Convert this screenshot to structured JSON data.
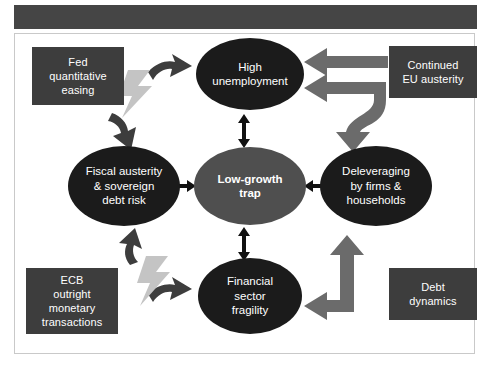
{
  "figure": {
    "banner_color": "#454545",
    "frame_color": "#c9c9c9",
    "background": "#ffffff"
  },
  "palette": {
    "box_fill": "#3d3d3d",
    "ellipse_dark": "#1b1b1b",
    "ellipse_center": "#4f4f4f",
    "arrow_black": "#111111",
    "arrow_gray": "#6b6b6b",
    "arrow_dark": "#3d3d3d",
    "bolt_gray": "#c4c4c4",
    "text": "#ffffff"
  },
  "nodes": {
    "boxes": [
      {
        "id": "fed-quantitative-easing",
        "lines": [
          "Fed",
          "quantitative",
          "easing"
        ],
        "x": 32,
        "y": 47,
        "w": 92,
        "h": 58
      },
      {
        "id": "continued-eu-austerity",
        "lines": [
          "Continued",
          "EU austerity"
        ],
        "x": 389,
        "y": 46,
        "w": 88,
        "h": 52
      },
      {
        "id": "ecb-outright-monetary-transactions",
        "lines": [
          "ECB",
          "outright",
          "monetary",
          "transactions"
        ],
        "x": 26,
        "y": 268,
        "w": 92,
        "h": 66
      },
      {
        "id": "debt-dynamics",
        "lines": [
          "Debt",
          "dynamics"
        ],
        "x": 389,
        "y": 268,
        "w": 88,
        "h": 52
      }
    ],
    "ellipses": [
      {
        "id": "high-unemployment",
        "lines": [
          "High",
          "unemployment"
        ],
        "x": 196,
        "y": 38,
        "w": 108,
        "h": 72,
        "kind": "dark"
      },
      {
        "id": "fiscal-austerity-sovereign-debt-risk",
        "lines": [
          "Fiscal austerity",
          "& sovereign",
          "debt risk"
        ],
        "x": 68,
        "y": 146,
        "w": 112,
        "h": 80,
        "kind": "dark"
      },
      {
        "id": "low-growth-trap",
        "lines": [
          "Low-growth",
          "trap"
        ],
        "x": 194,
        "y": 147,
        "w": 112,
        "h": 78,
        "kind": "mid"
      },
      {
        "id": "deleveraging-by-firms-households",
        "lines": [
          "Deleveraging",
          "by firms &",
          "households"
        ],
        "x": 320,
        "y": 146,
        "w": 112,
        "h": 80,
        "kind": "dark"
      },
      {
        "id": "financial-sector-fragility",
        "lines": [
          "Financial",
          "sector",
          "fragility"
        ],
        "x": 198,
        "y": 258,
        "w": 104,
        "h": 76,
        "kind": "dark"
      }
    ]
  },
  "connectors": [
    {
      "id": "unemployment-trap-link",
      "style": "double-headed-vertical",
      "color": "#111111"
    },
    {
      "id": "fiscal-trap-link",
      "style": "double-headed-horizontal",
      "color": "#111111"
    },
    {
      "id": "trap-deleveraging-link",
      "style": "double-headed-horizontal",
      "color": "#111111"
    },
    {
      "id": "trap-fragility-link",
      "style": "double-headed-vertical",
      "color": "#111111"
    },
    {
      "id": "fed-to-unemployment-arrow",
      "style": "curved-right",
      "color": "#3d3d3d"
    },
    {
      "id": "fed-to-fiscal-arrow",
      "style": "curved-down-left",
      "color": "#3d3d3d"
    },
    {
      "id": "ecb-to-fragility-arrow",
      "style": "curved-right",
      "color": "#3d3d3d"
    },
    {
      "id": "ecb-to-fiscal-arrow",
      "style": "curved-up-left",
      "color": "#3d3d3d"
    },
    {
      "id": "eu-austerity-to-unemployment-arrow",
      "style": "straight-left",
      "color": "#6b6b6b"
    },
    {
      "id": "eu-austerity-branching-arrow",
      "style": "branch-left-and-down",
      "color": "#6b6b6b"
    },
    {
      "id": "debt-dynamics-bent-arrow",
      "style": "bent-left-and-up",
      "color": "#6b6b6b"
    },
    {
      "id": "fed-lightning-bolt",
      "style": "lightning",
      "color": "#c4c4c4"
    },
    {
      "id": "ecb-lightning-bolt",
      "style": "lightning",
      "color": "#c4c4c4"
    }
  ]
}
